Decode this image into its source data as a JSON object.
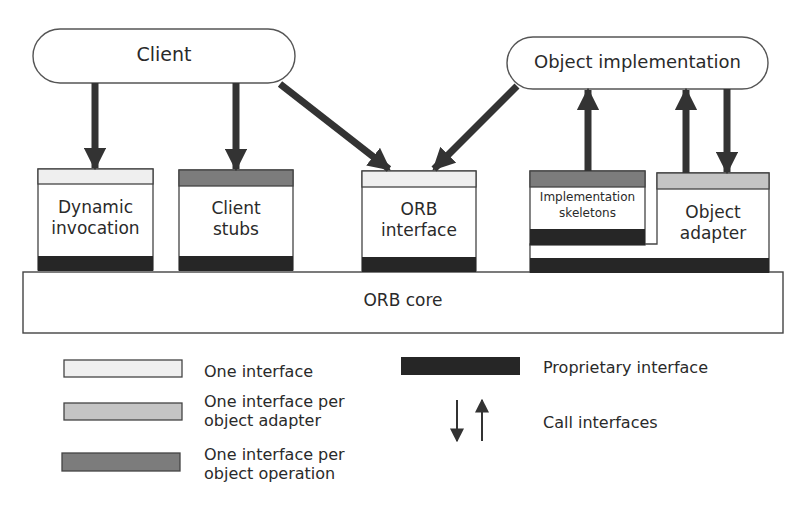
{
  "diagram": {
    "title": "",
    "colors": {
      "one_interface": "#efefef",
      "per_object_adapter": "#c4c4c4",
      "per_object_operation": "#7c7c7c",
      "proprietary": "#262626",
      "stroke": "#3a3a3a",
      "arrow": "#333333"
    },
    "top_nodes": {
      "client": "Client",
      "object_implementation": "Object implementation"
    },
    "components": {
      "dynamic_invocation": [
        "Dynamic",
        "invocation"
      ],
      "client_stubs": [
        "Client",
        "stubs"
      ],
      "orb_interface": [
        "ORB",
        "interface"
      ],
      "implementation_skeletons": [
        "Implementation",
        "skeletons"
      ],
      "object_adapter": [
        "Object",
        "adapter"
      ]
    },
    "base": {
      "orb_core": "ORB core"
    },
    "edges": [
      {
        "from": "Client",
        "to": "Dynamic invocation",
        "type": "call"
      },
      {
        "from": "Client",
        "to": "Client stubs",
        "type": "call"
      },
      {
        "from": "Client",
        "to": "ORB interface",
        "type": "call"
      },
      {
        "from": "Object implementation",
        "to": "ORB interface",
        "type": "call"
      },
      {
        "from": "Implementation skeletons",
        "to": "Object implementation",
        "type": "call"
      },
      {
        "from": "Object adapter",
        "to": "Object implementation",
        "type": "call"
      },
      {
        "from": "Object implementation",
        "to": "Object adapter",
        "type": "call"
      }
    ],
    "legend": [
      {
        "key": "one_interface",
        "label": [
          "One interface"
        ]
      },
      {
        "key": "per_object_adapter",
        "label": [
          "One interface per",
          "object adapter"
        ]
      },
      {
        "key": "per_object_operation",
        "label": [
          "One interface per",
          "object operation"
        ]
      },
      {
        "key": "proprietary",
        "label": [
          "Proprietary interface"
        ]
      },
      {
        "key": "call_arrows",
        "label": [
          "Call interfaces"
        ]
      }
    ]
  }
}
